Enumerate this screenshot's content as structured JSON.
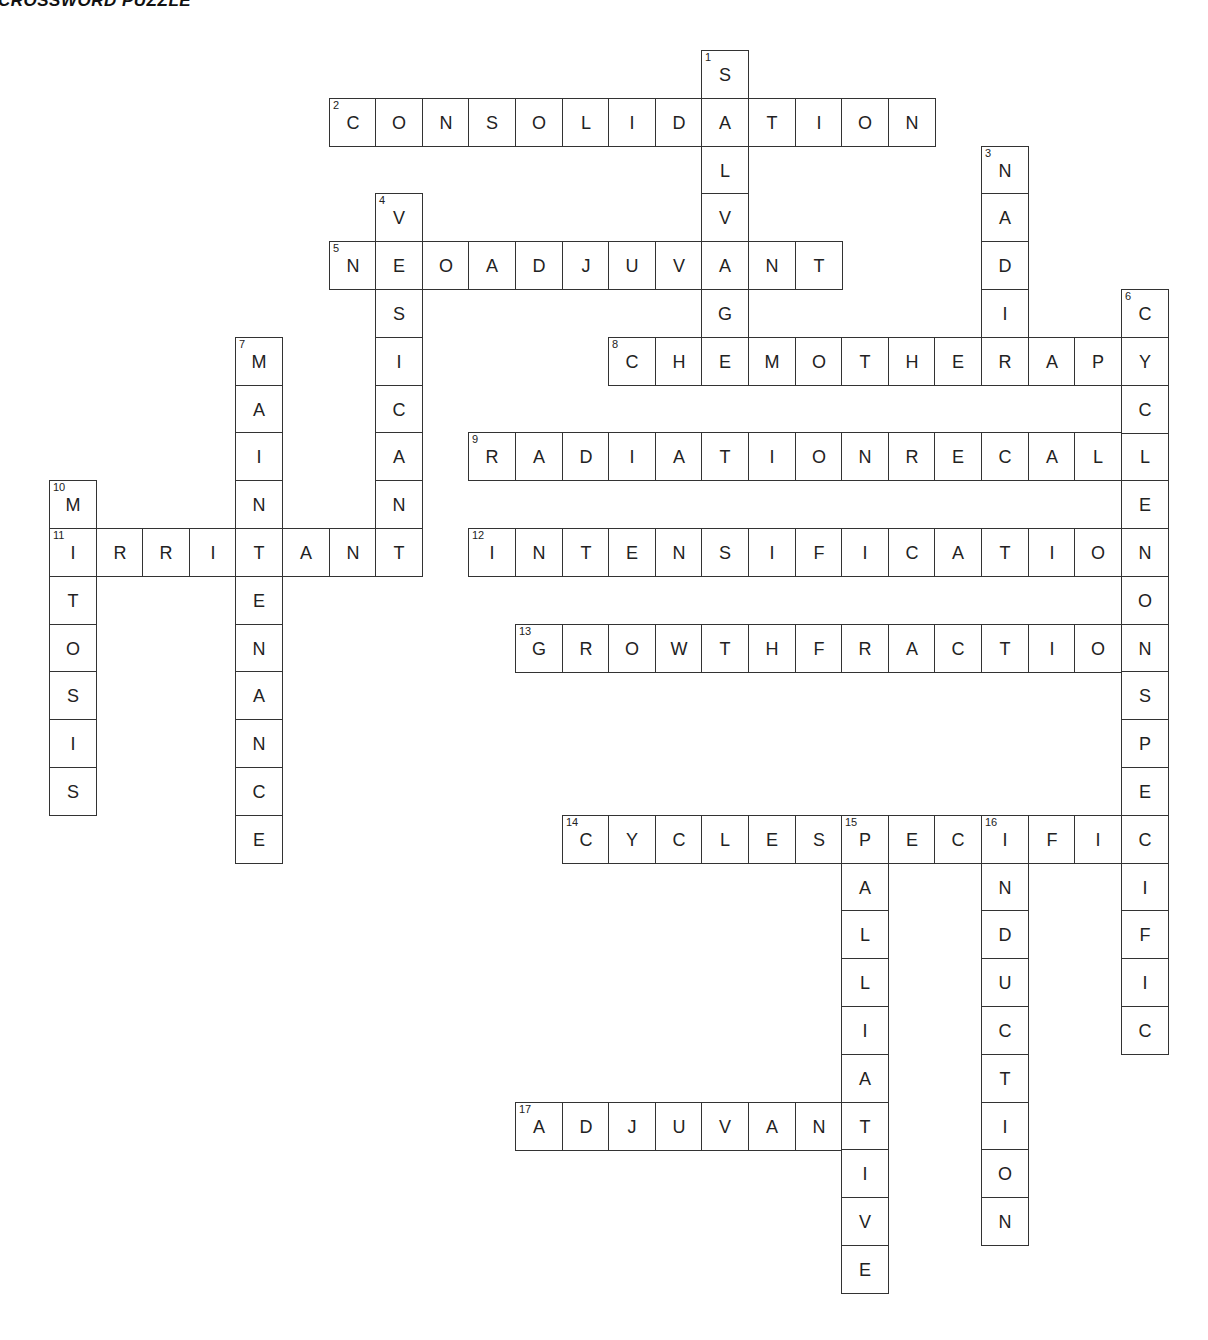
{
  "title": "CROSSWORD PUZZLE",
  "grid": {
    "origin_x": 49,
    "origin_y": 50,
    "cell_w": 46.6,
    "cell_h": 47.8
  },
  "across": [
    {
      "num": 2,
      "answer": "CONSOLIDATION",
      "row": 1,
      "col": 6
    },
    {
      "num": 5,
      "answer": "NEOADJUVANT",
      "row": 4,
      "col": 6
    },
    {
      "num": 8,
      "answer": "CHEMOTHERAPY",
      "row": 6,
      "col": 12
    },
    {
      "num": 9,
      "answer": "RADIATIONRECALL",
      "row": 8,
      "col": 9
    },
    {
      "num": 11,
      "answer": "IRRITANT",
      "row": 10,
      "col": 0
    },
    {
      "num": 12,
      "answer": "INTENSIFICATION",
      "row": 10,
      "col": 9
    },
    {
      "num": 13,
      "answer": "GROWTHFRACTION",
      "row": 12,
      "col": 10
    },
    {
      "num": 14,
      "answer": "CYCLESPECIFIC",
      "row": 16,
      "col": 11
    },
    {
      "num": 17,
      "answer": "ADJUVANT",
      "row": 22,
      "col": 10
    }
  ],
  "down": [
    {
      "num": 1,
      "answer": "SALVAGE",
      "row": 0,
      "col": 14
    },
    {
      "num": 3,
      "answer": "NADIR",
      "row": 2,
      "col": 20
    },
    {
      "num": 4,
      "answer": "VESICANT",
      "row": 3,
      "col": 7
    },
    {
      "num": 6,
      "answer": "CYCLENONSPECIFIC",
      "row": 5,
      "col": 23
    },
    {
      "num": 7,
      "answer": "MAINTENANCE",
      "row": 6,
      "col": 4
    },
    {
      "num": 10,
      "answer": "MITOSIS",
      "row": 9,
      "col": 0
    },
    {
      "num": 15,
      "answer": "PALLIATIVE",
      "row": 16,
      "col": 17
    },
    {
      "num": 16,
      "answer": "INDUCTION",
      "row": 16,
      "col": 20
    }
  ]
}
